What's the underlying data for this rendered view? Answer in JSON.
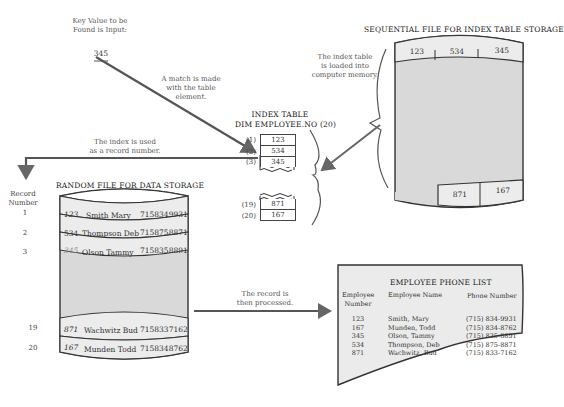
{
  "notes": {
    "key_value": "Key Value to be\nFound is Input:",
    "key_input": "345",
    "match": "A match is made\nwith the table\nelement.",
    "index_used": "The index is used\nas a record number.",
    "loaded": "The index table\nis loaded into\ncomputer memory.",
    "processed": "The record is\nthen processed."
  },
  "sequential_file": {
    "title": "SEQUENTIAL FILE FOR INDEX TABLE STORAGE",
    "top_cells": [
      "123",
      "534",
      "345"
    ],
    "bottom_cells": [
      "871",
      "167"
    ]
  },
  "index_table": {
    "title": "INDEX TABLE",
    "dim": "DIM EMPLOYEE.NO (20)",
    "rows_top": [
      {
        "index": "(1)",
        "value": "123"
      },
      {
        "index": "(2)",
        "value": "534"
      },
      {
        "index": "(3)",
        "value": "345"
      }
    ],
    "rows_bottom": [
      {
        "index": "(19)",
        "value": "871"
      },
      {
        "index": "(20)",
        "value": "167"
      }
    ]
  },
  "random_file": {
    "title": "RANDOM FILE FOR DATA STORAGE",
    "record_header": "Record\nNumber",
    "records_top": [
      {
        "num": "1",
        "key": "123",
        "name": "Smith Mary",
        "phone": "7158349931"
      },
      {
        "num": "2",
        "key": "534",
        "name": "Thompson Deb",
        "phone": "7158758871"
      },
      {
        "num": "3",
        "key": "345",
        "name": "Olson Tammy",
        "phone": "7158358891"
      }
    ],
    "records_bottom": [
      {
        "num": "19",
        "key": "871",
        "name": "Wachwitz Bud",
        "phone": "7158337162"
      },
      {
        "num": "20",
        "key": "167",
        "name": "Munden Todd",
        "phone": "7158348762"
      }
    ]
  },
  "phone_list": {
    "title": "EMPLOYEE PHONE LIST",
    "headers": [
      "Employee\nNumber",
      "Employee Name",
      "Phone Number"
    ],
    "rows": [
      [
        "123",
        "Smith, Mary",
        "(715) 834-9931"
      ],
      [
        "167",
        "Munden, Todd",
        "(715) 834-8762"
      ],
      [
        "345",
        "Olson, Tammy",
        "(715) 835-8891"
      ],
      [
        "534",
        "Thompson, Deb",
        "(715) 875-8871"
      ],
      [
        "871",
        "Wachwitz, Bud",
        "(715) 833-7162"
      ]
    ]
  },
  "colors": {
    "cylinder_fill": "#d9d9d9",
    "record_fill": "#ececec",
    "line": "#555555",
    "paper_fill": "#ebebeb"
  }
}
